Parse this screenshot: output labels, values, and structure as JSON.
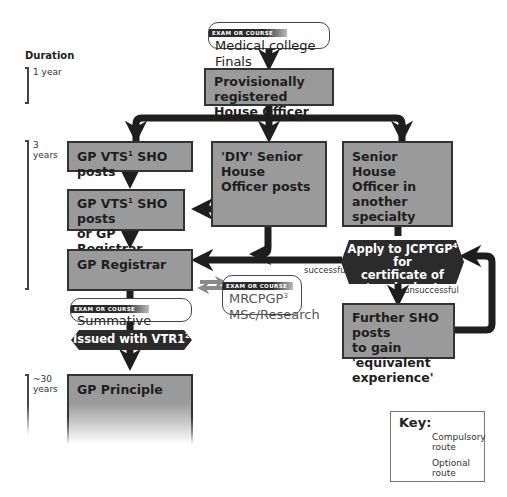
{
  "exam_tag": "EXAM OR COURSE",
  "duration": {
    "title": "Duration",
    "periods": [
      {
        "label_line1": "1 year",
        "label_line2": ""
      },
      {
        "label_line1": "3",
        "label_line2": "years"
      },
      {
        "label_line1": "~30",
        "label_line2": "years"
      }
    ]
  },
  "nodes": {
    "medical_finals": {
      "type": "exam",
      "text": "Medical college Finals"
    },
    "house_officer": {
      "type": "box",
      "line1": "Provisionally registered",
      "line2": "House Officer"
    },
    "gp_vts_sho": {
      "type": "box",
      "text_pre": "GP VTS",
      "sup": "1",
      "text_post": " SHO posts"
    },
    "diy_sho": {
      "type": "box",
      "line1": "'DIY' Senior House",
      "line2": "Officer posts"
    },
    "sho_other": {
      "type": "box",
      "line1": "Senior House",
      "line2": "Officer in another",
      "line3": "specialty"
    },
    "gp_vts_or_reg": {
      "type": "box",
      "text_pre": "GP VTS",
      "sup": "1",
      "text_post": " SHO posts",
      "line2": "or GP Registrar"
    },
    "gp_registrar": {
      "type": "box",
      "text": "GP Registrar"
    },
    "apply_jcptgp": {
      "type": "decision",
      "line1_pre": "Apply to JCPTGP",
      "sup": "4",
      "line1_post": " for",
      "line2": "certificate of 'equivalent",
      "line3": "experience'"
    },
    "mrcpgp": {
      "type": "exam",
      "text_pre": "MRCPGP",
      "sup": "3",
      "line2": "MSc/Research"
    },
    "summative": {
      "type": "exam",
      "text": "Summative assessment"
    },
    "vtr1": {
      "type": "milestone",
      "text_pre": "Issued with VTR1",
      "sup": "2"
    },
    "further_sho": {
      "type": "box",
      "line1": "Further SHO posts",
      "line2": "to gain 'equivalent",
      "line3": "experience'"
    },
    "gp_principle": {
      "type": "box",
      "text": "GP Principle"
    }
  },
  "edge_labels": {
    "successful": "successful",
    "unsuccessful": "unsuccessful"
  },
  "key": {
    "title": "Key:",
    "compulsory": "Compulsory route",
    "compulsory_line1": "Compulsory",
    "compulsory_line2": "route",
    "optional_line1": "Optional",
    "optional_line2": "route"
  },
  "colors": {
    "box_fill": "#9a9a9a",
    "box_border": "#333333",
    "arrow_compulsory": "#1e1e1e",
    "arrow_optional": "#8a8a8a",
    "milestone_fill": "#2b2b2b"
  }
}
